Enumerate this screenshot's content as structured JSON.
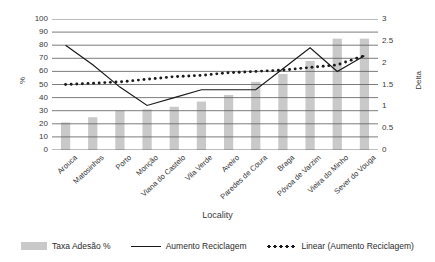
{
  "chart_data": {
    "type": "bar",
    "title": "",
    "xlabel": "Locality",
    "ylabel": "%",
    "y2label": "Delta",
    "ylim": [
      0,
      100
    ],
    "y2lim": [
      0,
      3
    ],
    "ytick_step": 10,
    "y2tick_step": 0.5,
    "grid": true,
    "legend_position": "bottom",
    "categories": [
      "Arouca",
      "Matosinhos",
      "Porto",
      "Monção",
      "Viana do Castelo",
      "Vila Verde",
      "Aveiro",
      "Paredes de Coura",
      "Braga",
      "Póvoa de Varzim",
      "Vieira do Minho",
      "Sever do Vouga"
    ],
    "yticks": [
      "0",
      "10",
      "20",
      "30",
      "40",
      "50",
      "60",
      "70",
      "80",
      "90",
      "100"
    ],
    "y2ticks": [
      "0",
      "0.5",
      "1",
      "1.5",
      "2",
      "2.5",
      "3"
    ],
    "series": [
      {
        "name": "Taxa Adesão %",
        "type": "bar",
        "axis": "left",
        "color": "#c9c9c9",
        "values": [
          21,
          25,
          30,
          31,
          33,
          37,
          42,
          52,
          58,
          68,
          85,
          85
        ]
      },
      {
        "name": "Aumento Reciclagem",
        "type": "line",
        "axis": "left",
        "color": "#1a1a1a",
        "values": [
          80,
          65,
          48,
          34,
          40,
          46,
          46,
          46,
          62,
          78,
          60,
          72
        ]
      },
      {
        "name": "Linear (Aumento Reciclagem)",
        "type": "line-dotted",
        "axis": "left",
        "color": "#1a1a1a",
        "values": [
          50,
          51,
          52,
          54,
          56,
          57,
          59,
          60,
          61,
          63,
          65,
          72
        ]
      }
    ]
  },
  "legend": {
    "items": [
      {
        "label": "Taxa Adesão %",
        "marker": "bar-swatch"
      },
      {
        "label": "Aumento Reciclagem",
        "marker": "solid-line-swatch"
      },
      {
        "label": "Linear (Aumento Reciclagem)",
        "marker": "dotted-line-swatch"
      }
    ]
  }
}
